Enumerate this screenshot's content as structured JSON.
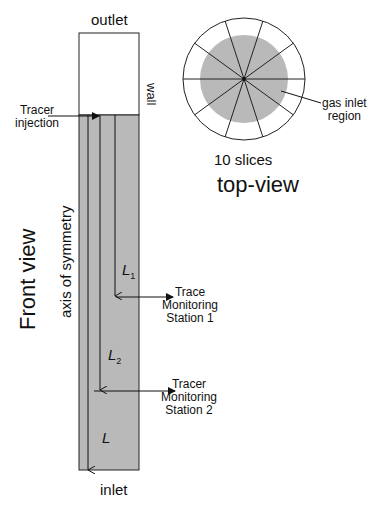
{
  "front_view": {
    "title": "Front view",
    "outlet_label": "outlet",
    "inlet_label": "inlet",
    "wall_label": "wall",
    "axis_label": "axis of symmetry",
    "injection_label_line1": "Tracer",
    "injection_label_line2": "injection",
    "lengths": {
      "L1": "L",
      "L1_sub": "1",
      "L2": "L",
      "L2_sub": "2",
      "L": "L"
    },
    "station1": {
      "line1": "Trace",
      "line2": "Monitoring",
      "line3": "Station 1"
    },
    "station2": {
      "line1": "Tracer",
      "line2": "Monitoring",
      "line3": "Station 2"
    }
  },
  "top_view": {
    "title": "top-view",
    "slices_label": "10 slices",
    "slice_count": 10,
    "region_label_line1": "gas inlet",
    "region_label_line2": "region"
  },
  "colors": {
    "fill_gray": "#b9b9b9",
    "stroke": "#222222"
  }
}
